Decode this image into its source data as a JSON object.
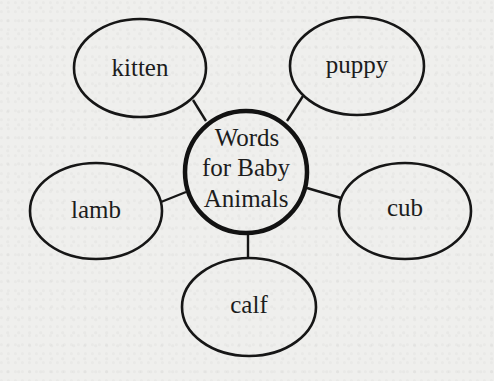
{
  "diagram": {
    "type": "word-web",
    "center": {
      "lines": [
        "Words",
        "for Baby",
        "Animals"
      ]
    },
    "nodes": [
      {
        "id": "kitten",
        "label": "kitten"
      },
      {
        "id": "puppy",
        "label": "puppy"
      },
      {
        "id": "lamb",
        "label": "lamb"
      },
      {
        "id": "cub",
        "label": "cub"
      },
      {
        "id": "calf",
        "label": "calf"
      }
    ],
    "colors": {
      "background": "#efefed",
      "stroke": "#161616",
      "text": "#1c1c1c"
    }
  }
}
